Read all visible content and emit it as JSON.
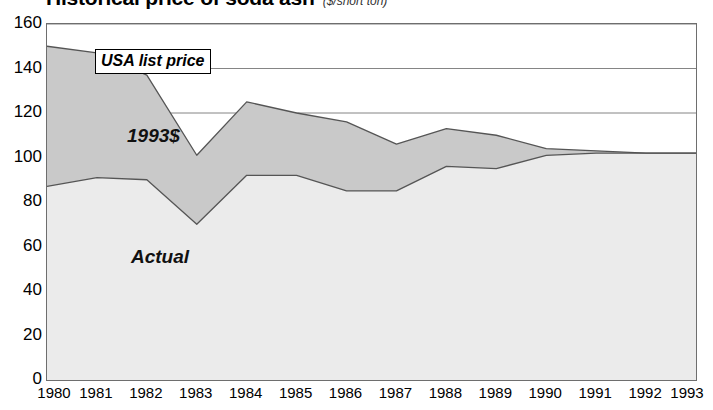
{
  "title": {
    "main": "Historical price of soda ash",
    "sub": "($/short ton)"
  },
  "legend": {
    "box_label": "USA list price"
  },
  "annotations": {
    "upper_band": "1993$",
    "lower_band": "Actual"
  },
  "axes": {
    "y_ticks": [
      "160",
      "140",
      "120",
      "100",
      "80",
      "60",
      "40",
      "20",
      "0"
    ],
    "x_ticks": [
      "1980",
      "1981",
      "1982",
      "1983",
      "1984",
      "1985",
      "1986",
      "1987",
      "1988",
      "1989",
      "1990",
      "1991",
      "1992",
      "1993"
    ]
  },
  "colors": {
    "upper_band_fill": "#c9c9c9",
    "lower_band_fill": "#ebebeb",
    "line": "#555555",
    "frame": "#6e6e6e",
    "gridline": "#777777",
    "text": "#000000"
  },
  "chart_data": {
    "type": "area",
    "title": "Historical price of soda ash",
    "subtitle": "($/short ton)",
    "xlabel": "",
    "ylabel": "($/short ton)",
    "ylim": [
      0,
      160
    ],
    "yticks": [
      0,
      20,
      40,
      60,
      80,
      100,
      120,
      140,
      160
    ],
    "grid": true,
    "legend": "USA list price",
    "legend_position": "top-left-inside",
    "x": [
      1980,
      1981,
      1982,
      1983,
      1984,
      1985,
      1986,
      1987,
      1988,
      1989,
      1990,
      1991,
      1992,
      1993
    ],
    "series": [
      {
        "name": "1993$",
        "values": [
          150,
          147,
          137,
          101,
          125,
          120,
          116,
          106,
          113,
          110,
          104,
          103,
          102,
          102
        ]
      },
      {
        "name": "Actual",
        "values": [
          87,
          91,
          90,
          70,
          92,
          92,
          85,
          85,
          96,
          95,
          101,
          102,
          102,
          102
        ]
      }
    ]
  }
}
